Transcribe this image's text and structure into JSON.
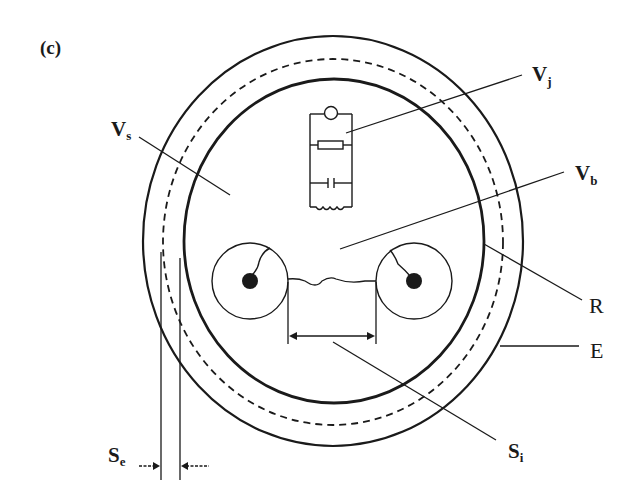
{
  "figure": {
    "panel_label": "(c)",
    "line_color": "#1a1a1a",
    "background": "#ffffff"
  },
  "labels": {
    "vs": {
      "main": "V",
      "sub": "s"
    },
    "vj": {
      "main": "V",
      "sub": "j"
    },
    "vb": {
      "main": "V",
      "sub": "b"
    },
    "r": {
      "main": "R"
    },
    "e": {
      "main": "E"
    },
    "si": {
      "main": "S",
      "sub": "i"
    },
    "se": {
      "main": "S",
      "sub": "e"
    }
  },
  "components": {
    "outer_ring": "E",
    "dashed_ring": "scalp/skin boundary",
    "inner_ring": "R",
    "circuit": [
      "lamp",
      "resistor",
      "capacitor",
      "inductor"
    ],
    "electrodes": 2
  }
}
